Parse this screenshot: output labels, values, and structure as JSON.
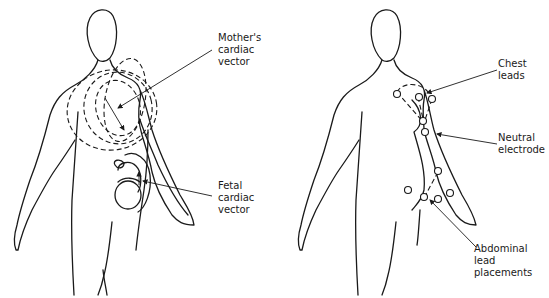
{
  "figure": {
    "left_panel": {
      "title": "Maternal and fetal cardiac vectors",
      "labels": {
        "mother_vector": "Mother's\ncardiac\nvector",
        "fetal_vector": "Fetal\ncardiac\nvector"
      }
    },
    "right_panel": {
      "title": "Electrode placement",
      "labels": {
        "chest_leads": "Chest\nleads",
        "neutral_electrode": "Neutral\nelectrode",
        "abdominal_leads": "Abdominal\nlead\nplacements"
      },
      "chest_electrode_count": 4,
      "neutral_electrode_count": 1,
      "abdominal_electrode_count": 5
    },
    "colors": {
      "line": "#1a1a1a",
      "background": "#ffffff"
    }
  }
}
